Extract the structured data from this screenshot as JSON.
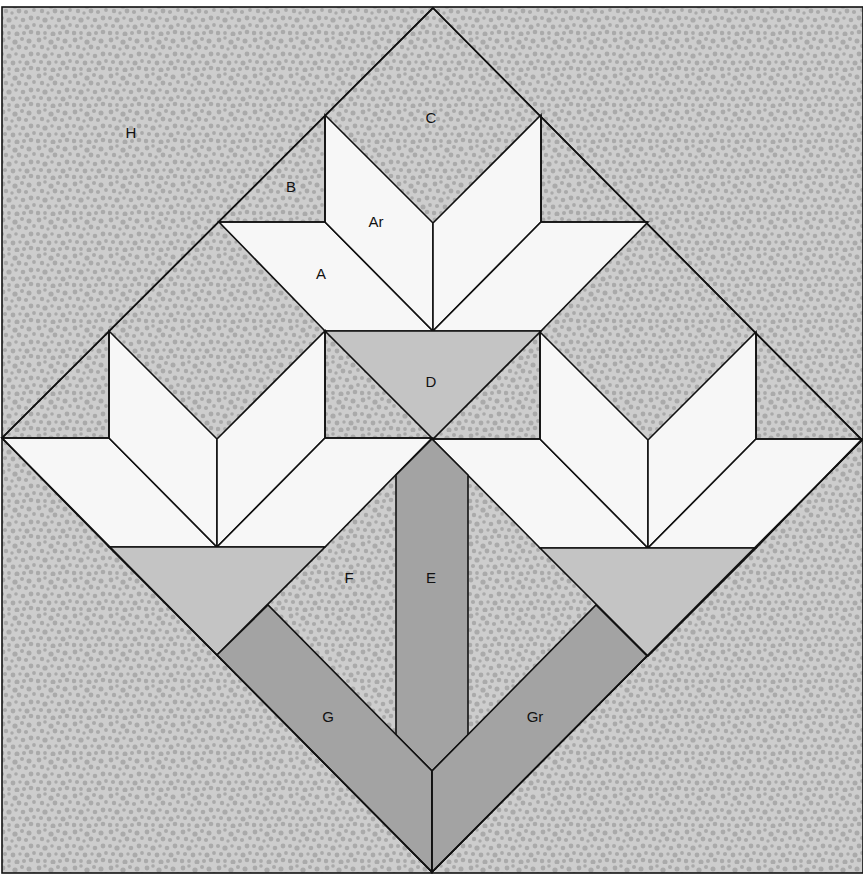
{
  "diagram": {
    "type": "quilt-block-template",
    "colors": {
      "background_speckle_base": "#c9c9c9",
      "background_speckle_dots": "#a9a9a9",
      "petal_white": "#f7f7f7",
      "calyx_light_gray": "#c4c4c4",
      "stem_mid_gray": "#a3a3a3",
      "outline": "#111111"
    },
    "labels": {
      "H": "H",
      "C": "C",
      "B": "B",
      "Ar": "Ar",
      "A": "A",
      "D": "D",
      "F": "F",
      "E": "E",
      "G": "G",
      "Gr": "Gr"
    },
    "pieces": [
      {
        "id": "H",
        "fill": "speckle",
        "description": "corner setting triangles"
      },
      {
        "id": "C",
        "fill": "speckle",
        "description": "square between petals"
      },
      {
        "id": "B",
        "fill": "speckle",
        "description": "small corner triangles"
      },
      {
        "id": "A",
        "fill": "white",
        "description": "petal parallelogram"
      },
      {
        "id": "Ar",
        "fill": "white",
        "description": "reversed petal parallelogram"
      },
      {
        "id": "D",
        "fill": "light-gray",
        "description": "flower base triangle"
      },
      {
        "id": "E",
        "fill": "mid-gray",
        "description": "center stem strip"
      },
      {
        "id": "F",
        "fill": "speckle",
        "description": "background between stems"
      },
      {
        "id": "G",
        "fill": "mid-gray",
        "description": "left branch stem"
      },
      {
        "id": "Gr",
        "fill": "mid-gray",
        "description": "right branch stem (reversed)"
      }
    ]
  }
}
